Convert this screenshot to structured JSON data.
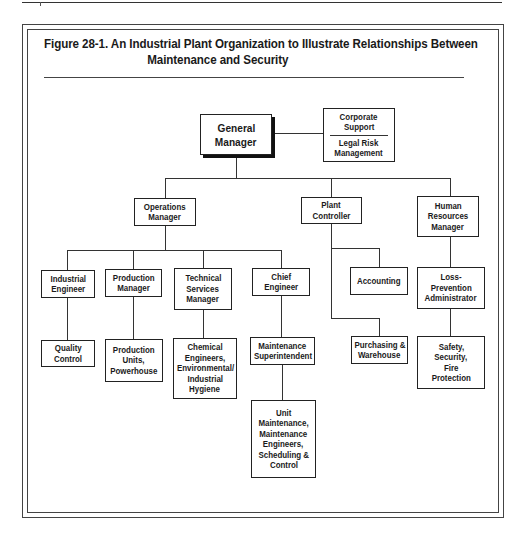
{
  "figure": {
    "title_line1": "Figure 28-1. An Industrial Plant Organization to Illustrate Relationships Between",
    "title_line2": "Maintenance and Security"
  },
  "nodes": {
    "general_manager": {
      "lines": [
        "General",
        "Manager"
      ]
    },
    "corporate_support": {
      "top_lines": [
        "Corporate",
        "Support"
      ],
      "bottom_lines": [
        "Legal Risk",
        "Management"
      ]
    },
    "operations_manager": {
      "lines": [
        "Operations",
        "Manager"
      ]
    },
    "plant_controller": {
      "lines": [
        "Plant",
        "Controller"
      ]
    },
    "hr_manager": {
      "lines": [
        "Human",
        "Resources",
        "Manager"
      ]
    },
    "industrial_engineer": {
      "lines": [
        "Industrial",
        "Engineer"
      ]
    },
    "production_manager": {
      "lines": [
        "Production",
        "Manager"
      ]
    },
    "technical_services_manager": {
      "lines": [
        "Technical",
        "Services",
        "Manager"
      ]
    },
    "chief_engineer": {
      "lines": [
        "Chief",
        "Engineer"
      ]
    },
    "accounting": {
      "lines": [
        "Accounting"
      ]
    },
    "loss_prevention": {
      "lines": [
        "Loss-",
        "Prevention",
        "Administrator"
      ]
    },
    "quality_control": {
      "lines": [
        "Quality",
        "Control"
      ]
    },
    "production_units": {
      "lines": [
        "Production",
        "Units,",
        "Powerhouse"
      ]
    },
    "chemical_engineers": {
      "lines": [
        "Chemical",
        "Engineers,",
        "Environmental/",
        "Industrial",
        "Hygiene"
      ]
    },
    "maintenance_superintendent": {
      "lines": [
        "Maintenance",
        "Superintendent"
      ]
    },
    "purchasing": {
      "lines": [
        "Purchasing &",
        "Warehouse"
      ]
    },
    "safety": {
      "lines": [
        "Safety,",
        "Security,",
        "Fire",
        "Protection"
      ]
    },
    "unit_maintenance": {
      "lines": [
        "Unit",
        "Maintenance,",
        "Maintenance",
        "Engineers,",
        "Scheduling &",
        "Control"
      ]
    }
  }
}
